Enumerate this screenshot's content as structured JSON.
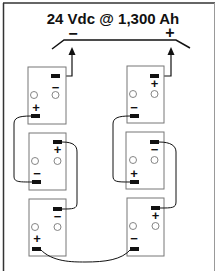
{
  "diagram": {
    "title": "24 Vdc @ 1,300 Ah",
    "bus": {
      "negative_label": "−",
      "positive_label": "+"
    },
    "batteries": [
      {
        "id": "L1",
        "top_sign": "−",
        "bottom_sign": "+"
      },
      {
        "id": "L2",
        "top_sign": "+",
        "bottom_sign": "−"
      },
      {
        "id": "L3",
        "top_sign": "−",
        "bottom_sign": "+"
      },
      {
        "id": "R1",
        "top_sign": "+",
        "bottom_sign": "−"
      },
      {
        "id": "R2",
        "top_sign": "−",
        "bottom_sign": "+"
      },
      {
        "id": "R3",
        "top_sign": "+",
        "bottom_sign": "−"
      }
    ],
    "colors": {
      "line": "#111111",
      "box": "#777777",
      "background": "#ffffff"
    }
  }
}
